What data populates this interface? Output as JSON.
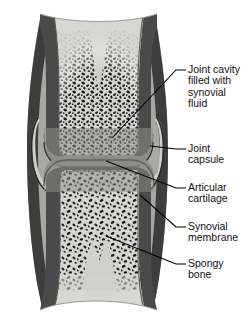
{
  "figure": {
    "view": "longitudinal section through a synovial joint",
    "background_color": "#ffffff",
    "colors": {
      "bone_light": "#c9c9c4",
      "marrow_light": "#d8d8d2",
      "cortical_dark": "#4a4a4a",
      "capsule_dark": "#3d3d3d",
      "cartilage_gray": "#8e8e88",
      "cavity_gray": "#a8a8a2",
      "trabecula_dark": "#1e1e1e",
      "leader_line": "#000000",
      "text": "#111111"
    },
    "parts": [
      {
        "name": "upper-bone-epiphysis",
        "tissue": "spongy bone in epiphysis"
      },
      {
        "name": "lower-bone-epiphysis",
        "tissue": "spongy bone in epiphysis"
      },
      {
        "name": "upper-shaft",
        "tissue": "compact bone diaphysis"
      },
      {
        "name": "lower-shaft",
        "tissue": "compact bone diaphysis"
      },
      {
        "name": "joint-cavity",
        "tissue": "synovial fluid space"
      },
      {
        "name": "upper-articular-cartilage",
        "tissue": "hyaline cartilage"
      },
      {
        "name": "lower-articular-cartilage",
        "tissue": "hyaline cartilage"
      },
      {
        "name": "joint-capsule",
        "tissue": "fibrous capsule"
      },
      {
        "name": "synovial-membrane",
        "tissue": "synovial lining"
      }
    ]
  },
  "labels": [
    {
      "id": "joint-cavity",
      "text": "Joint cavity\nfilled with\nsynovial\nfluid",
      "leader_from": [
        176,
        70
      ],
      "leader_to": [
        112,
        138
      ]
    },
    {
      "id": "joint-capsule",
      "text": "Joint\ncapsule",
      "leader_from": [
        176,
        149
      ],
      "leader_to": [
        148,
        146
      ]
    },
    {
      "id": "articular-cartilage",
      "text": "Articular\ncartilage",
      "leader_from": [
        176,
        188
      ],
      "leader_to": [
        107,
        161
      ]
    },
    {
      "id": "synovial-membrane",
      "text": "Synovial\nmembrane",
      "leader_from": [
        176,
        227
      ],
      "leader_to": [
        141,
        196
      ]
    },
    {
      "id": "spongy-bone",
      "text": "Spongy\nbone",
      "leader_from": [
        176,
        264
      ],
      "leader_to": [
        107,
        236
      ]
    }
  ]
}
